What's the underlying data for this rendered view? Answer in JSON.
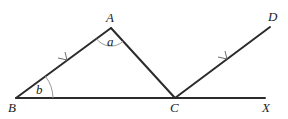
{
  "diagram": {
    "points": {
      "A": {
        "label": "A",
        "x": 111,
        "y": 28
      },
      "B": {
        "label": "B",
        "x": 16,
        "y": 98
      },
      "C": {
        "label": "C",
        "x": 175,
        "y": 98
      },
      "D": {
        "label": "D",
        "x": 270,
        "y": 27
      },
      "X": {
        "label": "X",
        "x": 265,
        "y": 98
      }
    },
    "segments": [
      "AB",
      "AC",
      "BX",
      "CD"
    ],
    "parallel_marks": [
      "AB",
      "CD"
    ],
    "angles": {
      "a": {
        "label": "a",
        "vertex": "A",
        "between": [
          "AB",
          "AC"
        ]
      },
      "b": {
        "label": "b",
        "vertex": "B",
        "between": [
          "BA",
          "BC"
        ]
      }
    },
    "colors": {
      "line": "#2b2b2b",
      "arc": "#9a9a9a",
      "text": "#222222",
      "background": "#ffffff"
    }
  }
}
